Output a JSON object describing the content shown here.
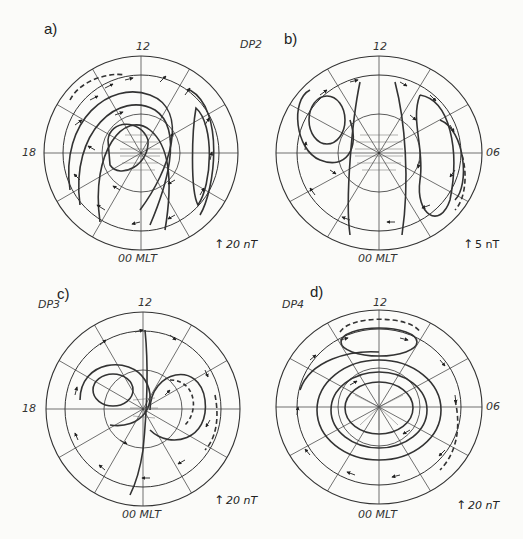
{
  "figure": {
    "panels": [
      {
        "id": "a",
        "letter": "a)",
        "label_noon": "12",
        "label_dusk": "18",
        "label_dawn": "",
        "label_midnight": "00 MLT",
        "type_label": "",
        "scale": "20 nT",
        "center": [
          141,
          153
        ],
        "rx": 97,
        "ry": 97
      },
      {
        "id": "b",
        "letter": "b)",
        "label_noon": "12",
        "label_dusk": "",
        "label_dawn": "06",
        "label_midnight": "00 MLT",
        "type_label": "DP2",
        "scale": "5 nT",
        "center": [
          379,
          153
        ],
        "rx": 103,
        "ry": 97
      },
      {
        "id": "c",
        "letter": "c)",
        "label_noon": "12",
        "label_dusk": "18",
        "label_dawn": "",
        "label_midnight": "00 MLT",
        "type_label": "DP3",
        "scale": "20 nT",
        "center": [
          143,
          409
        ],
        "rx": 97,
        "ry": 97
      },
      {
        "id": "d",
        "letter": "d)",
        "label_noon": "12",
        "label_dusk": "",
        "label_dawn": "06",
        "label_midnight": "00 MLT",
        "type_label": "DP4",
        "scale": "20 nT",
        "center": [
          379,
          407
        ],
        "rx": 103,
        "ry": 97
      }
    ]
  }
}
